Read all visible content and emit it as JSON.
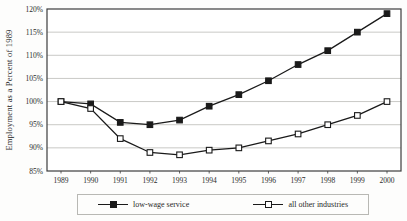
{
  "chart_data": {
    "type": "line",
    "title": "",
    "ylabel": "Employment as a Percent of 1989",
    "xlabel": "",
    "ylim": [
      85,
      120
    ],
    "ytick_step": 5,
    "ytick_suffix": "%",
    "grid": "horizontal",
    "legend_position": "bottom",
    "categories": [
      "1989",
      "1990",
      "1991",
      "1992",
      "1993",
      "1994",
      "1995",
      "1996",
      "1997",
      "1998",
      "1999",
      "2000"
    ],
    "series": [
      {
        "name": "low-wage service",
        "marker": "filled-square",
        "values": [
          100,
          99.5,
          95.5,
          95,
          96,
          99,
          101.5,
          104.5,
          108,
          111,
          115,
          119
        ]
      },
      {
        "name": "all other industries",
        "marker": "open-square",
        "values": [
          100,
          98.5,
          92,
          89,
          88.5,
          89.5,
          90,
          91.5,
          93,
          95,
          97,
          100
        ]
      }
    ]
  },
  "colors": {
    "series_line": "#1a1a1a",
    "frame": "#3c3c3c",
    "gridline": "#c9c9c6",
    "tick_text": "#2a2a2a",
    "background": "#fdfdfc"
  }
}
